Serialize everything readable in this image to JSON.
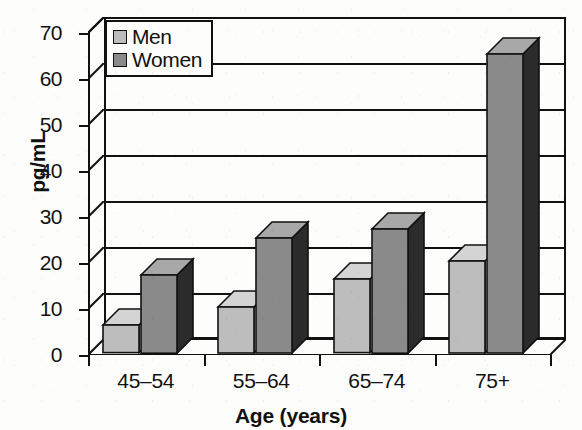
{
  "chart_data": {
    "type": "bar",
    "title": "",
    "subtitle": "",
    "xlabel": "Age (years)",
    "ylabel": "pg/mL",
    "categories": [
      "45–54",
      "55–64",
      "65–74",
      "75+"
    ],
    "series": [
      {
        "name": "Men",
        "values": [
          6,
          10,
          16,
          20
        ],
        "color": "#bdbdbd"
      },
      {
        "name": "Women",
        "values": [
          17,
          25,
          27,
          65
        ],
        "color": "#8a8a8a"
      }
    ],
    "ylim": [
      0,
      70
    ],
    "yticks": [
      0,
      10,
      20,
      30,
      40,
      50,
      60,
      70
    ],
    "ytick_labels": [
      "0",
      "10",
      "20",
      "30",
      "40",
      "50",
      "60",
      "70"
    ],
    "grid": true,
    "grid_axis": "y",
    "legend_position": "upper left",
    "style": "3d-bar",
    "palette": {
      "men_front": "#bdbdbd",
      "men_top": "#d4d4d4",
      "men_side": "#ffffff",
      "women_front": "#8a8a8a",
      "women_top": "#a8a8a8",
      "women_side": "#2b2b2b",
      "axis": "#111111",
      "background": "#fdfdfb"
    }
  },
  "legend": {
    "items": [
      {
        "label": "Men"
      },
      {
        "label": "Women"
      }
    ]
  },
  "axes": {
    "y_title": "pg/mL",
    "x_title": "Age (years)"
  }
}
